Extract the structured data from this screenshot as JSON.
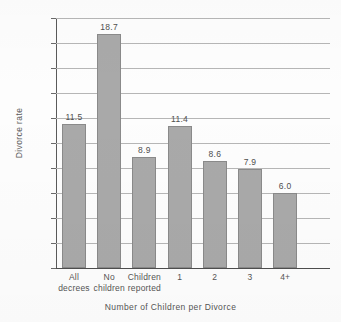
{
  "chart_data": {
    "type": "bar",
    "title": "",
    "xlabel": "Number of Children per Divorce",
    "ylabel": "Divorce rate",
    "categories": [
      "All decrees",
      "No children",
      "Children reported",
      "1",
      "2",
      "3",
      "4+"
    ],
    "category_lines": [
      [
        "All",
        "decrees"
      ],
      [
        "No",
        "children"
      ],
      [
        "Children",
        "reported"
      ],
      [
        "1",
        ""
      ],
      [
        "2",
        ""
      ],
      [
        "3",
        ""
      ],
      [
        "4+",
        ""
      ]
    ],
    "values": [
      11.5,
      18.7,
      8.9,
      11.4,
      8.6,
      7.9,
      6.0
    ],
    "value_labels": [
      "11.5",
      "18.7",
      "8.9",
      "11.4",
      "8.6",
      "7.9",
      "6.0"
    ],
    "ylim": [
      0,
      20
    ],
    "ytick_values": [
      0,
      2,
      4,
      6,
      8,
      10,
      12,
      14,
      16,
      18,
      20
    ],
    "ytick_labels": [
      "0",
      "2.0",
      "4.0",
      "6.0",
      "8.0",
      "10.0",
      "12.0",
      "14.0",
      "16.0",
      "18.0",
      "20.0"
    ],
    "grid": true,
    "legend": "none",
    "bar_color": "#a9a9a9",
    "bar_edge_color": "#8a8a8a",
    "gridline_color": "#b6b6b6",
    "axis_color": "#4e4e4e",
    "background_color": "#fdfdfd"
  }
}
